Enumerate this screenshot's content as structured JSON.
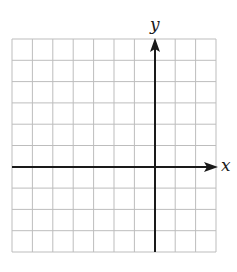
{
  "chart_data": {
    "type": "scatter",
    "title": "",
    "xlabel": "x",
    "ylabel": "y",
    "grid": true,
    "grid_columns": 10,
    "grid_rows": 10,
    "xlim": [
      -7,
      3
    ],
    "ylim": [
      -4,
      6
    ],
    "x_ticks": [],
    "y_ticks": [],
    "series": [],
    "legend": null,
    "note": "Blank coordinate grid with x- and y-axes; no tick labels or data plotted. The y-axis sits 7 cells from the left edge and the x-axis 6 cells from the top."
  },
  "labels": {
    "x_axis": "x",
    "y_axis": "y"
  },
  "colors": {
    "grid_line": "#bdbdbd",
    "axis": "#1a1a1a",
    "background": "#ffffff"
  }
}
